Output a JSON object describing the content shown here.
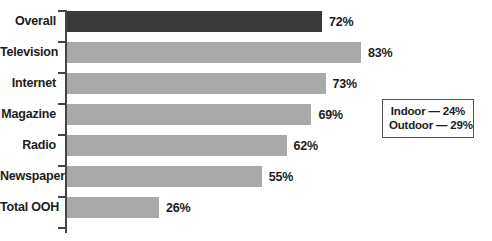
{
  "chart_data": {
    "type": "bar",
    "orientation": "horizontal",
    "title": "",
    "subtitle": "",
    "xlabel": "",
    "ylabel": "",
    "xlim": [
      0,
      100
    ],
    "grid": false,
    "value_suffix": "%",
    "categories": [
      "Overall",
      "Television",
      "Internet",
      "Magazine",
      "Radio",
      "Newspaper",
      "Total OOH"
    ],
    "values": [
      72,
      83,
      73,
      69,
      62,
      55,
      26
    ],
    "value_labels": [
      "72%",
      "83%",
      "73%",
      "69%",
      "62%",
      "55%",
      "26%"
    ],
    "highlight_index": 0,
    "colors": {
      "bar": "#a9a9a9",
      "bar_highlight": "#3a3a3a",
      "axis": "#444444",
      "text": "#1c1c1c",
      "callout_border": "#555555",
      "background": "#ffffff"
    },
    "annotations": {
      "position": "right-middle",
      "lines": [
        "Indoor — 24%",
        "Outdoor — 29%"
      ],
      "items": [
        {
          "label": "Indoor",
          "value": 24,
          "text": "Indoor — 24%"
        },
        {
          "label": "Outdoor",
          "value": 29,
          "text": "Outdoor — 29%"
        }
      ]
    }
  }
}
